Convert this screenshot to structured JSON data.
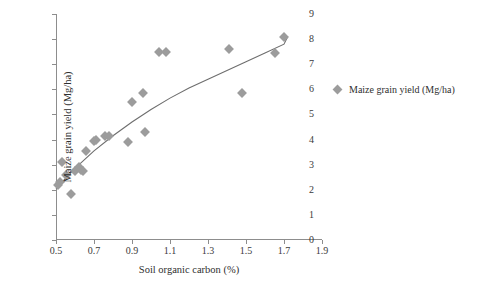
{
  "chart_data": {
    "type": "scatter",
    "title": "",
    "xlabel": "Soil organic carbon (%)",
    "ylabel": "Maize grain yield (Mg/ha)",
    "xlim": [
      0.5,
      1.9
    ],
    "ylim": [
      0,
      9
    ],
    "xticks": [
      0.5,
      0.7,
      0.9,
      1.1,
      1.3,
      1.5,
      1.7,
      1.9
    ],
    "xtick_labels": [
      "0.5",
      "0.7",
      "0.9",
      "1.1",
      "1.3",
      "1.5",
      "1.7",
      "1.9"
    ],
    "yticks": [
      0,
      1,
      2,
      3,
      4,
      5,
      6,
      7,
      8,
      9
    ],
    "ytick_labels": [
      "0",
      "1",
      "2",
      "3",
      "4",
      "5",
      "6",
      "7",
      "8",
      "9"
    ],
    "grid": false,
    "marker": "diamond",
    "marker_color": "#9c9c9c",
    "axis_color": "#8d8d8d",
    "trendline_color": "#6e6e6e",
    "legend": {
      "position": "right",
      "entries": [
        {
          "label": "Maize grain yield (Mg/ha)",
          "color": "#9c9c9c"
        }
      ]
    },
    "series": [
      {
        "name": "Maize grain yield (Mg/ha)",
        "points": [
          {
            "x": 0.51,
            "y": 2.2
          },
          {
            "x": 0.52,
            "y": 2.3
          },
          {
            "x": 0.53,
            "y": 3.1
          },
          {
            "x": 0.55,
            "y": 2.6
          },
          {
            "x": 0.58,
            "y": 1.85
          },
          {
            "x": 0.6,
            "y": 2.75
          },
          {
            "x": 0.62,
            "y": 2.9
          },
          {
            "x": 0.63,
            "y": 2.8
          },
          {
            "x": 0.64,
            "y": 2.75
          },
          {
            "x": 0.66,
            "y": 3.55
          },
          {
            "x": 0.7,
            "y": 3.95
          },
          {
            "x": 0.71,
            "y": 4.0
          },
          {
            "x": 0.76,
            "y": 4.15
          },
          {
            "x": 0.78,
            "y": 4.15
          },
          {
            "x": 0.88,
            "y": 3.9
          },
          {
            "x": 0.9,
            "y": 5.5
          },
          {
            "x": 0.96,
            "y": 5.85
          },
          {
            "x": 0.97,
            "y": 4.3
          },
          {
            "x": 1.04,
            "y": 7.5
          },
          {
            "x": 1.08,
            "y": 7.5
          },
          {
            "x": 1.41,
            "y": 7.6
          },
          {
            "x": 1.48,
            "y": 5.85
          },
          {
            "x": 1.65,
            "y": 7.45
          },
          {
            "x": 1.7,
            "y": 8.1
          }
        ]
      }
    ],
    "trendline": {
      "type": "logarithmic",
      "points": [
        {
          "x": 0.5,
          "y": 2.05
        },
        {
          "x": 0.55,
          "y": 2.45
        },
        {
          "x": 0.6,
          "y": 2.85
        },
        {
          "x": 0.65,
          "y": 3.2
        },
        {
          "x": 0.7,
          "y": 3.55
        },
        {
          "x": 0.8,
          "y": 4.15
        },
        {
          "x": 0.9,
          "y": 4.7
        },
        {
          "x": 1.0,
          "y": 5.2
        },
        {
          "x": 1.1,
          "y": 5.65
        },
        {
          "x": 1.2,
          "y": 6.05
        },
        {
          "x": 1.3,
          "y": 6.4
        },
        {
          "x": 1.4,
          "y": 6.75
        },
        {
          "x": 1.5,
          "y": 7.1
        },
        {
          "x": 1.6,
          "y": 7.45
        },
        {
          "x": 1.7,
          "y": 7.8
        },
        {
          "x": 1.72,
          "y": 8.1
        }
      ]
    }
  }
}
